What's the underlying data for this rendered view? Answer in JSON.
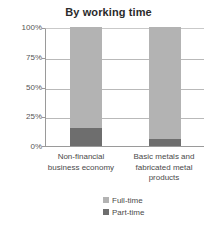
{
  "chart_data": {
    "type": "bar",
    "subtype": "stacked-percentage-column",
    "title": "By working time",
    "xlabel": "",
    "ylabel": "",
    "ylim": [
      0,
      100
    ],
    "ytick_labels": [
      "100%",
      "75%",
      "50%",
      "25%",
      "0%"
    ],
    "ytick_values": [
      100,
      75,
      50,
      25,
      0
    ],
    "grid": true,
    "legend_position": "bottom-center",
    "categories": [
      "Non-financial business economy",
      "Basic metals and fabricated metal products"
    ],
    "series": [
      {
        "name": "Full-time",
        "color": "#b3b3b3",
        "values": [
          85,
          94
        ]
      },
      {
        "name": "Part-time",
        "color": "#6e6e6e",
        "values": [
          15,
          6
        ]
      }
    ]
  },
  "colors": {
    "full_time": "#b3b3b3",
    "part_time": "#6e6e6e",
    "gridline": "#b9b9b9",
    "axis": "#9a9a9a",
    "title_text": "#2b2b2b",
    "label_text": "#4a4a4a",
    "background": "#ffffff"
  }
}
